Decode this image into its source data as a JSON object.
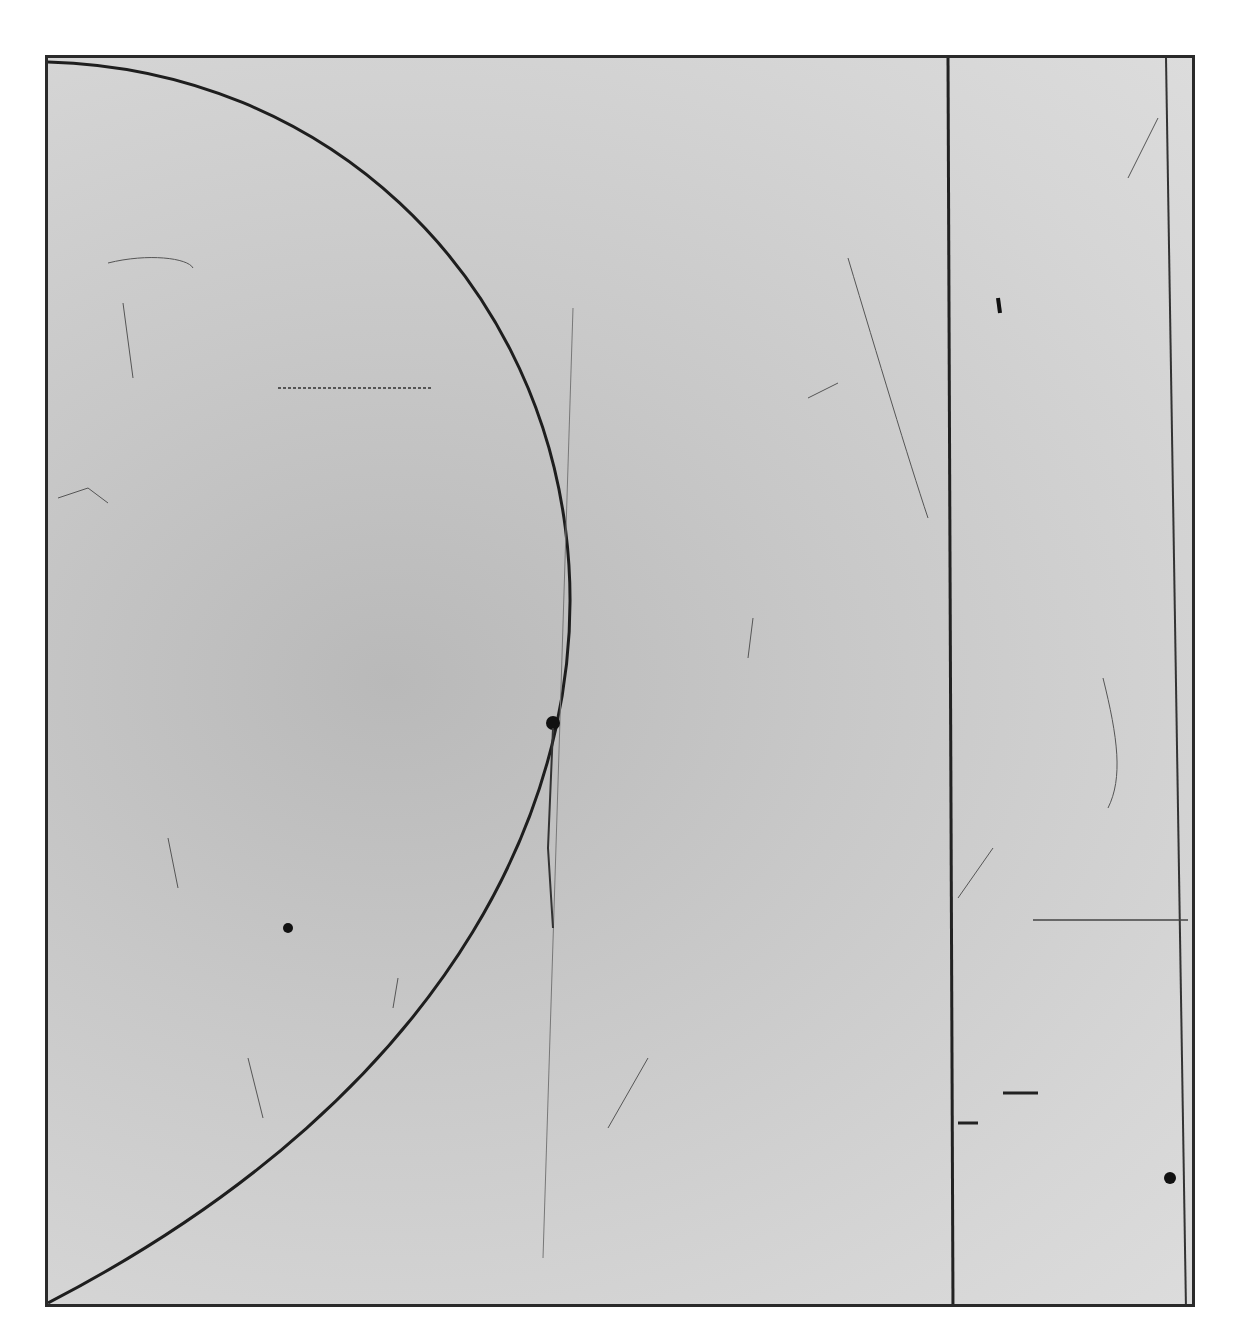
{
  "artwork": {
    "type": "etching-print",
    "description": "Abstract intaglio print: rectangular plate with a large semicircular arc on the left and vertical dividing lines on the right",
    "colors": {
      "paper": "#ffffff",
      "plate_tone": "#c8c8c8",
      "line": "#1e1e1e"
    },
    "elements": [
      {
        "name": "semicircle-arc",
        "kind": "arc"
      },
      {
        "name": "vertical-divider",
        "kind": "line"
      },
      {
        "name": "right-inner-rule",
        "kind": "line"
      },
      {
        "name": "horizontal-short-rule",
        "kind": "line"
      },
      {
        "name": "ink-spot-center",
        "kind": "mark"
      },
      {
        "name": "ink-spot-lower-left",
        "kind": "mark"
      },
      {
        "name": "ink-spot-lower-right",
        "kind": "mark"
      }
    ]
  }
}
